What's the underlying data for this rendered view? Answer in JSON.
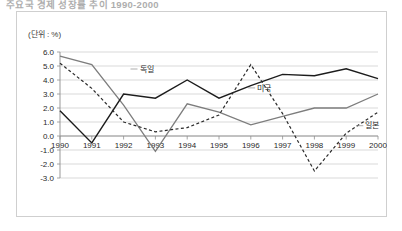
{
  "page": {
    "title": "주요국 경제 성장률 추이 1990-2000"
  },
  "chart": {
    "unit_label": "(단위 : %)"
  },
  "chart_data": {
    "type": "line",
    "title": "주요국 경제 성장률 추이 1990-2000",
    "xlabel": "",
    "ylabel": "(단위 : %)",
    "categories": [
      "1990",
      "1991",
      "1992",
      "1993",
      "1994",
      "1995",
      "1996",
      "1997",
      "1998",
      "1999",
      "2000"
    ],
    "x": [
      1990,
      1991,
      1992,
      1993,
      1994,
      1995,
      1996,
      1997,
      1998,
      1999,
      2000
    ],
    "ylim": [
      -3.0,
      6.0
    ],
    "ytick_labels": [
      "6.0",
      "5.0",
      "4.0",
      "3.0",
      "2.0",
      "1.0",
      "0.0",
      "-1.0",
      "-2.0",
      "-3.0"
    ],
    "yticks": [
      6.0,
      5.0,
      4.0,
      3.0,
      2.0,
      1.0,
      0.0,
      -1.0,
      -2.0,
      -3.0
    ],
    "grid": true,
    "legend_position": "inline-annotations",
    "series": [
      {
        "name": "독일",
        "style": "solid",
        "color": "#7d7d7d",
        "width": 1.3,
        "values": [
          5.7,
          5.1,
          2.2,
          -1.1,
          2.3,
          1.7,
          0.8,
          1.4,
          2.0,
          2.0,
          3.0
        ],
        "label_x": 1992.5,
        "label_y": 4.6
      },
      {
        "name": "미국",
        "style": "solid",
        "color": "#1c1c1c",
        "width": 1.4,
        "values": [
          1.8,
          -0.5,
          3.0,
          2.7,
          4.0,
          2.7,
          3.6,
          4.4,
          4.3,
          4.8,
          4.1
        ],
        "label_x": 1996.2,
        "label_y": 3.25
      },
      {
        "name": "일본",
        "style": "dashed",
        "color": "#2b2b2b",
        "width": 1.2,
        "values": [
          5.2,
          3.4,
          1.0,
          0.3,
          0.6,
          1.5,
          5.1,
          1.6,
          -2.5,
          0.2,
          1.7
        ],
        "label_x": 1999.6,
        "label_y": 0.55
      }
    ],
    "annotations": [
      {
        "text": "독일",
        "series": "독일"
      },
      {
        "text": "미국",
        "series": "미국"
      },
      {
        "text": "일본",
        "series": "일본"
      }
    ]
  }
}
